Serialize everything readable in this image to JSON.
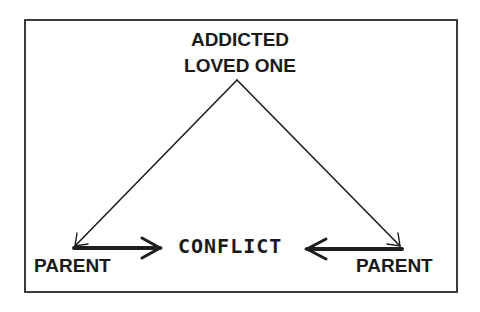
{
  "diagram": {
    "top_node": {
      "line1": "ADDICTED",
      "line2": "LOVED ONE"
    },
    "left_node": "PARENT",
    "right_node": "PARENT",
    "center_label": "CONFLICT",
    "edges": [
      {
        "from": "ADDICTED LOVED ONE",
        "to": "PARENT (left)",
        "style": "thin arrow"
      },
      {
        "from": "ADDICTED LOVED ONE",
        "to": "PARENT (right)",
        "style": "thin arrow"
      },
      {
        "from": "PARENT (left)",
        "to": "CONFLICT",
        "style": "thick arrow"
      },
      {
        "from": "PARENT (right)",
        "to": "CONFLICT",
        "style": "thick arrow"
      }
    ],
    "colors": {
      "ink": "#1a1a1a",
      "background": "#ffffff"
    }
  }
}
